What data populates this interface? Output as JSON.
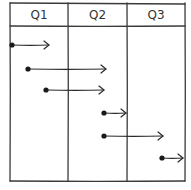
{
  "diagram": {
    "type": "timeline-table",
    "columns": [
      {
        "label": "Q1",
        "x0": 10,
        "x1": 68
      },
      {
        "label": "Q2",
        "x0": 68,
        "x1": 127
      },
      {
        "label": "Q3",
        "x0": 127,
        "x1": 185
      }
    ],
    "grid": {
      "left": 10,
      "right": 185,
      "top": 3,
      "header_bottom": 26,
      "bottom": 181,
      "stroke": "#3a3a3a"
    },
    "arrows": [
      {
        "start_x": 12,
        "end_x": 49,
        "y": 45
      },
      {
        "start_x": 28,
        "end_x": 106,
        "y": 69
      },
      {
        "start_x": 46,
        "end_x": 104,
        "y": 90
      },
      {
        "start_x": 104,
        "end_x": 126,
        "y": 113
      },
      {
        "start_x": 104,
        "end_x": 163,
        "y": 136
      },
      {
        "start_x": 162,
        "end_x": 183,
        "y": 158
      }
    ]
  }
}
